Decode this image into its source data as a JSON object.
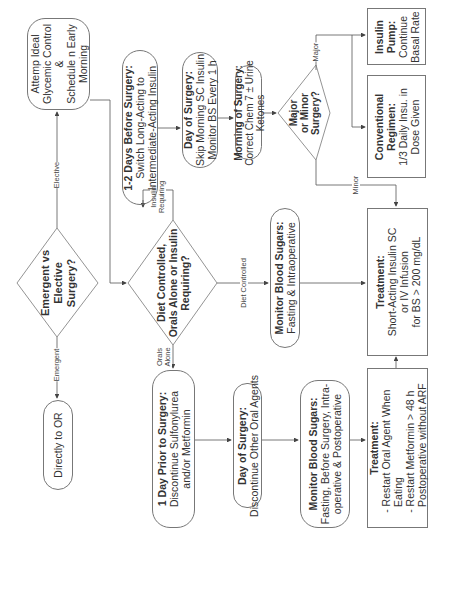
{
  "diagram": {
    "orientation": "rotated-90-ccw",
    "start": {
      "question": "Emergent vs Elective Surgery?"
    },
    "emergent": {
      "edge_label": "Emergent",
      "node": "Directly to OR"
    },
    "elective": {
      "edge_label": "Elective",
      "node": [
        "Attemp Ideal",
        "Glycemic Control",
        "&",
        "Schedule n Early",
        "Morning"
      ]
    },
    "regimen_question": {
      "lines": [
        "Diet Controlled,",
        "Orals Alone or Insulin",
        "Requiring?"
      ]
    },
    "insulin_branch": {
      "edge_label": [
        "Insulin",
        "Requiring"
      ],
      "step1": {
        "title": "1-2 Days Before Surgery:",
        "lines": [
          "Switch Long-Acting to",
          "Intermediate-Acting Insulin"
        ]
      },
      "step2": {
        "title": "Day of Surgery:",
        "lines": [
          "Skip Morning SC Insulin",
          "Monitor BS Every 1 h"
        ]
      },
      "step3": {
        "title": "Morning of Surgery:",
        "lines": [
          "Correct Chem 7 ± Urine",
          "Ketones"
        ]
      },
      "question": {
        "lines": [
          "Major",
          "or Minor",
          "Surgery?"
        ]
      },
      "major_label": "Major",
      "minor_label": "Minor",
      "conventional": {
        "title": [
          "Conventional",
          "Regimen:"
        ],
        "lines": [
          "1/3 Daily Insu. in",
          "Dose Given"
        ]
      },
      "pump": {
        "title": [
          "Insulin",
          "Pump:"
        ],
        "lines": [
          "Continue",
          "Basal Rate"
        ]
      }
    },
    "diet_branch": {
      "edge_label": "Diet Controlled",
      "monitor": {
        "title": "Monitor Blood Sugars:",
        "lines": [
          "Fasting & Intraoperative"
        ]
      }
    },
    "treatment_main": {
      "title": "Treatment:",
      "lines": [
        "Short-Acting Insulin SC",
        "or IV Infusion",
        "for BS > 200 mg/dL"
      ]
    },
    "orals_branch": {
      "edge_label": [
        "Orals",
        "Alone"
      ],
      "step1": {
        "title": "1 Day Prior to Surgery:",
        "lines": [
          "Discontinue Sulfonylurea",
          "and/or Metformin"
        ]
      },
      "step2": {
        "title": "Day of Surgery:",
        "lines": [
          "Discontinue Other Oral Agents"
        ]
      },
      "monitor": {
        "title": "Monitor Blood Sugars:",
        "lines": [
          "Fasting, Before Surgery, Intra-",
          "operative & Postoperative"
        ]
      },
      "treatment": {
        "title": "Treatment:",
        "lines": [
          "- Restart Oral Agent When",
          "  Eating",
          "- Restart Metformin > 48 h",
          "  Postoperative without ARF"
        ]
      }
    },
    "colors": {
      "line": "#555555",
      "border": "#777777",
      "text": "#333333",
      "background": "#ffffff"
    }
  }
}
